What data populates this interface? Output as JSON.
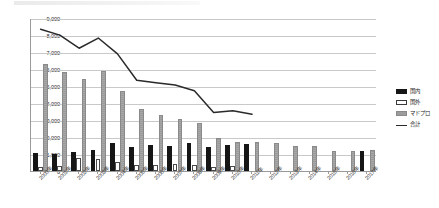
{
  "chart_data": {
    "type": "bar",
    "title": "",
    "xlabel": "",
    "ylabel": "",
    "ylim": [
      0,
      9000
    ],
    "ytick_step": 1000,
    "grid": true,
    "legend_position": "right",
    "categories": [
      "2000年",
      "2001年",
      "2002年",
      "2003年",
      "2004年",
      "2005年",
      "2006年",
      "2007年",
      "2008年",
      "2009年",
      "2010年",
      "2011年",
      "2012年",
      "2013年",
      "2014年",
      "2015年",
      "2016年",
      "2017年"
    ],
    "ytick_labels": [
      "0",
      "1,000",
      "2,000",
      "3,000",
      "4,000",
      "5,000",
      "6,000",
      "7,000",
      "8,000",
      "9,000"
    ],
    "series": [
      {
        "name": "国内",
        "type": "bar",
        "color": "#161616",
        "values": [
          1050,
          1000,
          1100,
          1250,
          1620,
          1400,
          1520,
          1500,
          1650,
          1400,
          1550,
          1600,
          0,
          0,
          0,
          0,
          0,
          1150
        ]
      },
      {
        "name": "国外",
        "type": "bar",
        "color": "#ffffff",
        "values": [
          250,
          300,
          760,
          720,
          550,
          380,
          340,
          430,
          330,
          230,
          300,
          0,
          0,
          0,
          0,
          0,
          0,
          0
        ]
      },
      {
        "name": "マドプロ",
        "type": "bar",
        "color": "#9c9c9c",
        "values": [
          6300,
          5820,
          5400,
          5880,
          4680,
          3620,
          3300,
          3080,
          2830,
          1950,
          1700,
          1720,
          1650,
          1500,
          1450,
          1150,
          1180,
          1220
        ]
      },
      {
        "name": "合計",
        "type": "line",
        "color": "#2a2a2a",
        "values": [
          8400,
          8050,
          7280,
          7880,
          6950,
          5400,
          5250,
          5120,
          4780,
          3500,
          3600,
          3400,
          null,
          null,
          null,
          null,
          null,
          null
        ]
      }
    ]
  },
  "legend": {
    "items": [
      {
        "label": "国内",
        "swatch": "black-square-icon"
      },
      {
        "label": "国外",
        "swatch": "white-square-icon"
      },
      {
        "label": "マドプロ",
        "swatch": "gray-square-icon"
      },
      {
        "label": "合計",
        "swatch": "line-segment-icon"
      }
    ]
  }
}
